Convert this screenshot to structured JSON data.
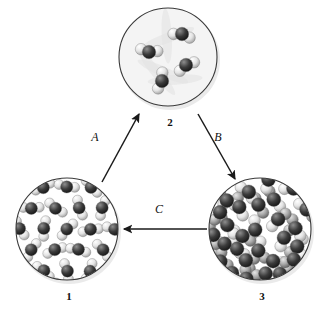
{
  "figure": {
    "type": "states-of-matter-cycle",
    "background_color": "#ffffff",
    "panels": [
      {
        "id": "panel-1",
        "label": "1",
        "state": "solid",
        "description": "Ordered crystalline lattice of triatomic molecules with open hexagonal voids",
        "center_x": 67,
        "center_y": 229,
        "radius": 52,
        "packing": "ordered",
        "molecule_count": 19,
        "has_voids": true
      },
      {
        "id": "panel-2",
        "label": "2",
        "state": "gas",
        "description": "Four widely separated triatomic molecules on a pale background",
        "center_x": 168,
        "center_y": 57,
        "radius": 50,
        "packing": "dispersed",
        "molecule_count": 4,
        "has_voids": true
      },
      {
        "id": "panel-3",
        "label": "3",
        "state": "liquid",
        "description": "Dense disordered close packing of molecules with no voids",
        "center_x": 260,
        "center_y": 229,
        "radius": 52,
        "packing": "disordered-dense",
        "molecule_count": 28,
        "has_voids": false
      }
    ],
    "arrows": [
      {
        "id": "arrow-a",
        "label": "A",
        "from_panel": "1",
        "to_panel": "2",
        "x1": 102,
        "y1": 182,
        "x2": 139,
        "y2": 114,
        "label_x": 95,
        "label_y": 137,
        "direction": "up-right"
      },
      {
        "id": "arrow-b",
        "label": "B",
        "from_panel": "2",
        "to_panel": "3",
        "x1": 198,
        "y1": 114,
        "x2": 235,
        "y2": 179,
        "label_x": 218,
        "label_y": 137,
        "direction": "down-right"
      },
      {
        "id": "arrow-c",
        "label": "C",
        "from_panel": "3",
        "to_panel": "1",
        "x1": 207,
        "y1": 229,
        "x2": 124,
        "y2": 229,
        "label_x": 159,
        "label_y": 209,
        "direction": "left"
      }
    ],
    "colors": {
      "stroke": "#1a1a1a",
      "text": "#111111",
      "atom_dark": "#2a2a2a",
      "atom_mid": "#9a9a9a",
      "atom_light": "#ececec",
      "circle_rim": "#3a3a3a",
      "panel2_bg": "#f4f4f4",
      "shadow": "#d8d8d8"
    }
  }
}
